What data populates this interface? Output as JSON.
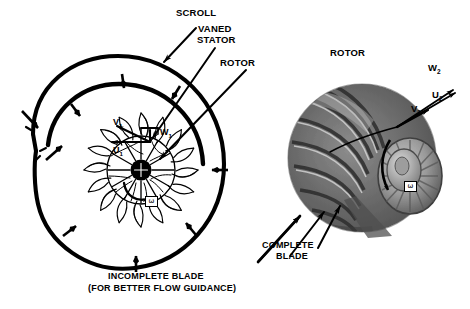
{
  "figure": {
    "background_color": "#ffffff",
    "ink_color": "#000000",
    "labels": {
      "scroll": "SCROLL",
      "vaned_stator_line1": "VANED",
      "vaned_stator_line2": "STATOR",
      "rotor_left": "ROTOR",
      "rotor_right": "ROTOR",
      "complete_blade_line1": "COMPLETE",
      "complete_blade_line2": "BLADE",
      "incomplete_blade_line1": "INCOMPLETE BLADE",
      "incomplete_blade_line2": "(FOR BETTER FLOW GUIDANCE)"
    },
    "velocity_vectors_inlet": {
      "absolute": "V",
      "absolute_sub": "1",
      "relative": "W",
      "relative_sub": "1",
      "blade_speed": "U",
      "blade_speed_sub": "1"
    },
    "velocity_vectors_exit": {
      "relative": "W",
      "relative_sub": "2",
      "blade_speed": "U",
      "blade_speed_sub": "2",
      "absolute": "V",
      "absolute_sub": "2"
    },
    "rotation_markers": {
      "cross_section_symbol": "ω",
      "photo_symbol": "ω"
    },
    "components": {
      "left_view": "radial-inflow-turbine-cross-section",
      "right_view": "rotor-photograph"
    }
  }
}
